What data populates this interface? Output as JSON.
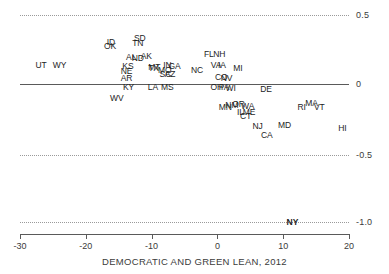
{
  "chart_data": {
    "type": "scatter",
    "title": "",
    "xlabel": "DEMOCRATIC AND GREEN LEAN, 2012",
    "ylabel": "",
    "xlim": [
      -30,
      20
    ],
    "ylim": [
      -1.0,
      0.5
    ],
    "grid": true,
    "legend": "none",
    "xticks": [
      "-30",
      "-20",
      "-10",
      "0",
      "10",
      "20"
    ],
    "xtick_values": [
      -30,
      -20,
      -10,
      0,
      10,
      20
    ],
    "yticks": [
      "0.5",
      "0",
      "-0.5",
      "-1.0"
    ],
    "ytick_values": [
      0.5,
      0,
      -0.5,
      -1.0
    ],
    "point_labels": [
      {
        "label": "UT",
        "x": -26.8,
        "y": 0.135
      },
      {
        "label": "WY",
        "x": -24.0,
        "y": 0.135
      },
      {
        "label": "ID",
        "x": -16.2,
        "y": 0.305
      },
      {
        "label": "OK",
        "x": -16.3,
        "y": 0.275
      },
      {
        "label": "SD",
        "x": -11.8,
        "y": 0.33
      },
      {
        "label": "TN",
        "x": -12.1,
        "y": 0.3
      },
      {
        "label": "AL",
        "x": -13.1,
        "y": 0.195
      },
      {
        "label": "ND",
        "x": -12.1,
        "y": 0.185
      },
      {
        "label": "AK",
        "x": -10.8,
        "y": 0.2
      },
      {
        "label": "KS",
        "x": -13.6,
        "y": 0.13
      },
      {
        "label": "NE",
        "x": -13.8,
        "y": 0.095
      },
      {
        "label": "AR",
        "x": -13.8,
        "y": 0.045
      },
      {
        "label": "KY",
        "x": -13.5,
        "y": -0.025
      },
      {
        "label": "MT",
        "x": -9.6,
        "y": 0.125
      },
      {
        "label": "TX",
        "x": -9.7,
        "y": 0.118
      },
      {
        "label": "MO",
        "x": -8.0,
        "y": 0.105
      },
      {
        "label": "IN",
        "x": -7.6,
        "y": 0.135
      },
      {
        "label": "GA",
        "x": -6.5,
        "y": 0.13
      },
      {
        "label": "SC",
        "x": -7.9,
        "y": 0.072
      },
      {
        "label": "AZ",
        "x": -7.2,
        "y": 0.07
      },
      {
        "label": "LA",
        "x": -9.8,
        "y": -0.025
      },
      {
        "label": "MS",
        "x": -7.6,
        "y": -0.025
      },
      {
        "label": "WV",
        "x": -15.3,
        "y": -0.105
      },
      {
        "label": "FL",
        "x": -1.3,
        "y": 0.215
      },
      {
        "label": "NH",
        "x": 0.3,
        "y": 0.215
      },
      {
        "label": "NC",
        "x": -3.1,
        "y": 0.105
      },
      {
        "label": "VA",
        "x": -0.2,
        "y": 0.135
      },
      {
        "label": "IA",
        "x": 0.7,
        "y": 0.135
      },
      {
        "label": "MI",
        "x": 3.1,
        "y": 0.118
      },
      {
        "label": "CO",
        "x": 0.6,
        "y": 0.05
      },
      {
        "label": "NV",
        "x": 1.4,
        "y": 0.042
      },
      {
        "label": "OH",
        "x": -0.1,
        "y": -0.022
      },
      {
        "label": "PA",
        "x": 1.0,
        "y": -0.02
      },
      {
        "label": "WI",
        "x": 2.0,
        "y": -0.03
      },
      {
        "label": "DE",
        "x": 7.4,
        "y": -0.035
      },
      {
        "label": "MN",
        "x": 1.2,
        "y": -0.165
      },
      {
        "label": "NM",
        "x": 2.2,
        "y": -0.15
      },
      {
        "label": "OR",
        "x": 3.2,
        "y": -0.148
      },
      {
        "label": "WA",
        "x": 4.6,
        "y": -0.158
      },
      {
        "label": "IL",
        "x": 3.5,
        "y": -0.2
      },
      {
        "label": "ME",
        "x": 4.8,
        "y": -0.205
      },
      {
        "label": "CT",
        "x": 4.3,
        "y": -0.235
      },
      {
        "label": "MA",
        "x": 14.3,
        "y": -0.14
      },
      {
        "label": "RI",
        "x": 12.8,
        "y": -0.165
      },
      {
        "label": "VT",
        "x": 15.5,
        "y": -0.165
      },
      {
        "label": "NJ",
        "x": 6.1,
        "y": -0.305
      },
      {
        "label": "MD",
        "x": 10.2,
        "y": -0.3
      },
      {
        "label": "HI",
        "x": 19.0,
        "y": -0.32
      },
      {
        "label": "CA",
        "x": 7.5,
        "y": -0.37
      },
      {
        "label": "NY",
        "x": 11.4,
        "y": -1.0,
        "bold": true
      }
    ]
  }
}
